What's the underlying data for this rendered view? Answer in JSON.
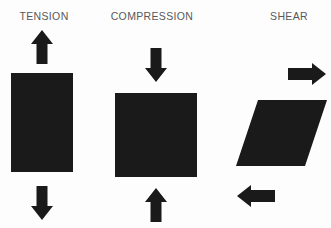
{
  "figure": {
    "background_color": "#fdfdfd",
    "shape_color": "#1a1a1a",
    "label_color": "#58585a"
  },
  "panels": [
    {
      "id": "tension",
      "label": "TENSION",
      "body_shape": "rectangle",
      "body": {
        "x": 11,
        "y": 73,
        "width": 62,
        "height": 99
      },
      "arrows": [
        {
          "name": "tension-arrow-up",
          "direction": "up",
          "x": 31,
          "y": 30,
          "width": 22,
          "height": 34
        },
        {
          "name": "tension-arrow-down",
          "direction": "down",
          "x": 31,
          "y": 186,
          "width": 22,
          "height": 34
        }
      ]
    },
    {
      "id": "compression",
      "label": "COMPRESSION",
      "body_shape": "rectangle",
      "body": {
        "x": 115,
        "y": 93,
        "width": 82,
        "height": 84
      },
      "arrows": [
        {
          "name": "compression-arrow-down",
          "direction": "down",
          "x": 145,
          "y": 48,
          "width": 22,
          "height": 34
        },
        {
          "name": "compression-arrow-up",
          "direction": "up",
          "x": 145,
          "y": 188,
          "width": 22,
          "height": 34
        }
      ]
    },
    {
      "id": "shear",
      "label": "SHEAR",
      "body_shape": "parallelogram",
      "body": {
        "top_left_x": 258,
        "top_right_x": 327,
        "bottom_left_x": 236,
        "bottom_right_x": 305,
        "top_y": 100,
        "bottom_y": 166
      },
      "arrows": [
        {
          "name": "shear-arrow-right",
          "direction": "right",
          "x": 288,
          "y": 63,
          "width": 38,
          "height": 22
        },
        {
          "name": "shear-arrow-left",
          "direction": "left",
          "x": 237,
          "y": 185,
          "width": 38,
          "height": 22
        }
      ]
    }
  ]
}
